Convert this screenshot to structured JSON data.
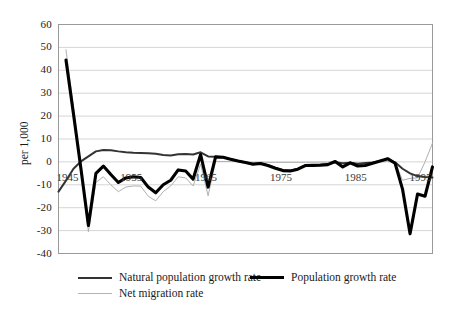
{
  "chart_data": {
    "type": "line",
    "title": "",
    "xlabel": "",
    "ylabel": "per 1,000",
    "xlim": [
      1945,
      1995
    ],
    "ylim": [
      -40,
      60
    ],
    "grid": "horizontal",
    "legend_position": "bottom-left",
    "yticks": [
      60,
      50,
      40,
      30,
      20,
      10,
      0,
      -10,
      -20,
      -30,
      -40
    ],
    "xticks": [
      1945,
      1955,
      1965,
      1975,
      1985,
      1995
    ],
    "x": [
      1945,
      1946,
      1947,
      1948,
      1949,
      1950,
      1951,
      1952,
      1953,
      1954,
      1955,
      1956,
      1957,
      1958,
      1959,
      1960,
      1961,
      1962,
      1963,
      1964,
      1965,
      1966,
      1967,
      1968,
      1969,
      1970,
      1971,
      1972,
      1973,
      1974,
      1975,
      1976,
      1977,
      1978,
      1979,
      1980,
      1981,
      1982,
      1983,
      1984,
      1985,
      1986,
      1987,
      1988,
      1989,
      1990,
      1991,
      1992,
      1993,
      1994,
      1995
    ],
    "series": [
      {
        "name": "Population growth rate",
        "style": "thick-black",
        "color": "#000000",
        "width": 3.1,
        "values": [
          null,
          44.5,
          21.0,
          -3.0,
          -27.8,
          -5.0,
          -1.8,
          -5.5,
          -9.0,
          -7.0,
          -6.5,
          -6.8,
          -11.0,
          -13.5,
          -10.0,
          -8.0,
          -3.5,
          -4.0,
          -7.5,
          3.2,
          -11.0,
          2.2,
          2.0,
          1.2,
          0.4,
          -0.3,
          -1.0,
          -0.7,
          -1.6,
          -2.8,
          -3.8,
          -4.0,
          -3.2,
          -1.6,
          -1.5,
          -1.4,
          -1.2,
          0.2,
          -2.2,
          -0.4,
          -1.8,
          -1.6,
          -0.6,
          0.4,
          1.4,
          -0.6,
          -12.0,
          -31.4,
          -14.0,
          -15.0,
          -2.2
        ]
      },
      {
        "name": "Natural population growth rate",
        "style": "medium-black",
        "color": "#333333",
        "width": 2.0,
        "values": [
          -13.0,
          -8.2,
          -3.0,
          0.2,
          2.4,
          4.6,
          5.2,
          5.1,
          4.6,
          4.2,
          4.0,
          3.9,
          3.8,
          3.6,
          3.0,
          2.8,
          3.3,
          3.4,
          3.2,
          4.2,
          2.4,
          2.2,
          2.0,
          1.2,
          0.4,
          -0.2,
          -0.8,
          -0.6,
          -1.4,
          -2.6,
          -3.6,
          -3.8,
          -3.0,
          -1.4,
          -1.4,
          -1.3,
          -1.1,
          -0.2,
          -0.6,
          -0.4,
          -0.8,
          -0.5,
          -0.3,
          0.4,
          1.2,
          -0.2,
          -3.0,
          -5.0,
          -6.2,
          -6.6,
          -6.8
        ]
      },
      {
        "name": "Net migration rate",
        "style": "thin-gray",
        "color": "#b0b0b0",
        "width": 1.0,
        "values": [
          null,
          49.0,
          24.0,
          -3.0,
          -30.5,
          -9.0,
          -6.5,
          -10.0,
          -13.0,
          -11.0,
          -10.5,
          -10.6,
          -15.0,
          -17.0,
          -13.0,
          -10.5,
          -6.5,
          -7.0,
          -10.5,
          -1.0,
          -14.8,
          0.2,
          0.2,
          0.2,
          0.2,
          0.0,
          -0.2,
          -0.1,
          -0.2,
          -0.2,
          -0.2,
          -0.2,
          -0.2,
          -0.2,
          -0.1,
          -0.1,
          -0.1,
          0.4,
          -1.6,
          0.0,
          -1.0,
          -1.1,
          -0.3,
          0.0,
          0.2,
          -0.4,
          -8.0,
          -7.2,
          -7.0,
          0.0,
          8.2
        ]
      }
    ]
  },
  "axis": {
    "y_title": "per 1,000",
    "y_tick_labels": [
      "60",
      "50",
      "40",
      "30",
      "20",
      "10",
      "0",
      "-10",
      "-20",
      "-30",
      "-40"
    ],
    "x_tick_labels": [
      "1945",
      "1955",
      "1965",
      "1975",
      "1985",
      "1995"
    ]
  },
  "legend": {
    "items": [
      {
        "label": "Natural population growth rate",
        "style": "medium-black"
      },
      {
        "label": "Population growth rate",
        "style": "thick-black"
      },
      {
        "label": "Net migration rate",
        "style": "thin-gray"
      }
    ]
  }
}
